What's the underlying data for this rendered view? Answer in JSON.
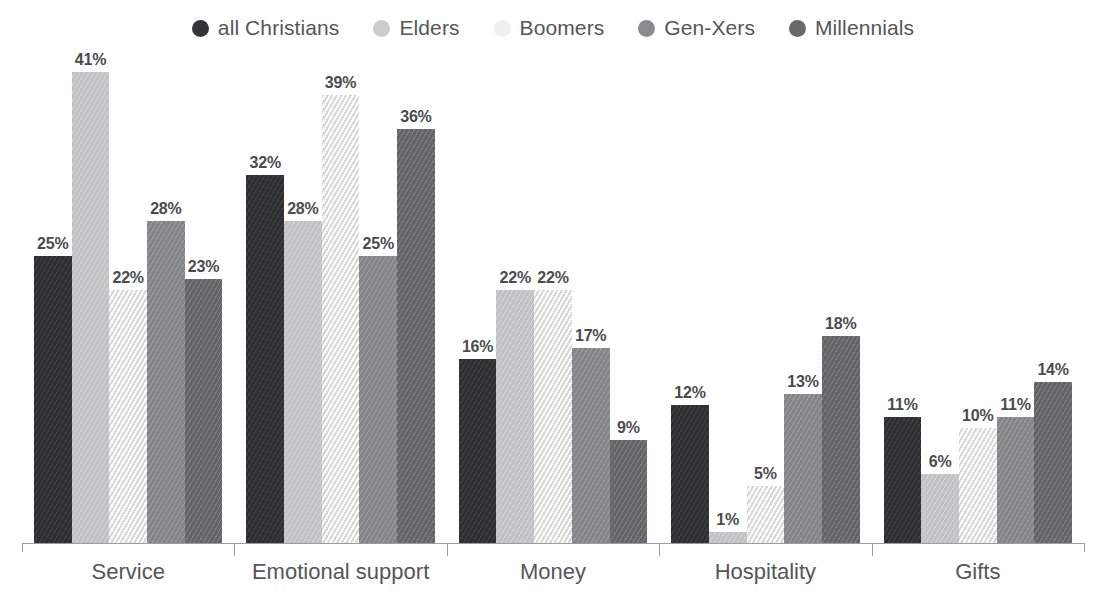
{
  "legend": {
    "items": [
      {
        "label": "all Christians",
        "color": "#333436",
        "icon": "circle-marker"
      },
      {
        "label": "Elders",
        "color": "#cbcccd",
        "icon": "circle-marker"
      },
      {
        "label": "Boomers",
        "color": "#f0f0ef",
        "icon": "circle-marker"
      },
      {
        "label": "Gen-Xers",
        "color": "#8b8c8e",
        "icon": "circle-marker"
      },
      {
        "label": "Millennials",
        "color": "#69696b",
        "icon": "circle-marker"
      }
    ]
  },
  "chart_data": {
    "type": "bar",
    "title": "",
    "xlabel": "",
    "ylabel": "",
    "ylim": [
      0,
      41
    ],
    "grid": false,
    "legend_position": "top-center",
    "value_label_suffix": "%",
    "categories": [
      "Service",
      "Emotional support",
      "Money",
      "Hospitality",
      "Gifts"
    ],
    "series": [
      {
        "name": "all Christians",
        "color": "#333436",
        "values": [
          25,
          32,
          16,
          12,
          11
        ]
      },
      {
        "name": "Elders",
        "color": "#cbcccd",
        "values": [
          41,
          28,
          22,
          1,
          6
        ]
      },
      {
        "name": "Boomers",
        "color": "#f0f0ef",
        "values": [
          22,
          39,
          22,
          5,
          10
        ]
      },
      {
        "name": "Gen-Xers",
        "color": "#8b8c8e",
        "values": [
          28,
          25,
          17,
          13,
          11
        ]
      },
      {
        "name": "Millennials",
        "color": "#69696b",
        "values": [
          23,
          36,
          9,
          18,
          14
        ]
      }
    ],
    "value_labels": [
      [
        "25%",
        "41%",
        "22%",
        "28%",
        "23%"
      ],
      [
        "32%",
        "28%",
        "39%",
        "25%",
        "36%"
      ],
      [
        "16%",
        "22%",
        "22%",
        "17%",
        "9%"
      ],
      [
        "12%",
        "1%",
        "5%",
        "13%",
        "18%"
      ],
      [
        "11%",
        "6%",
        "10%",
        "11%",
        "14%"
      ]
    ]
  }
}
